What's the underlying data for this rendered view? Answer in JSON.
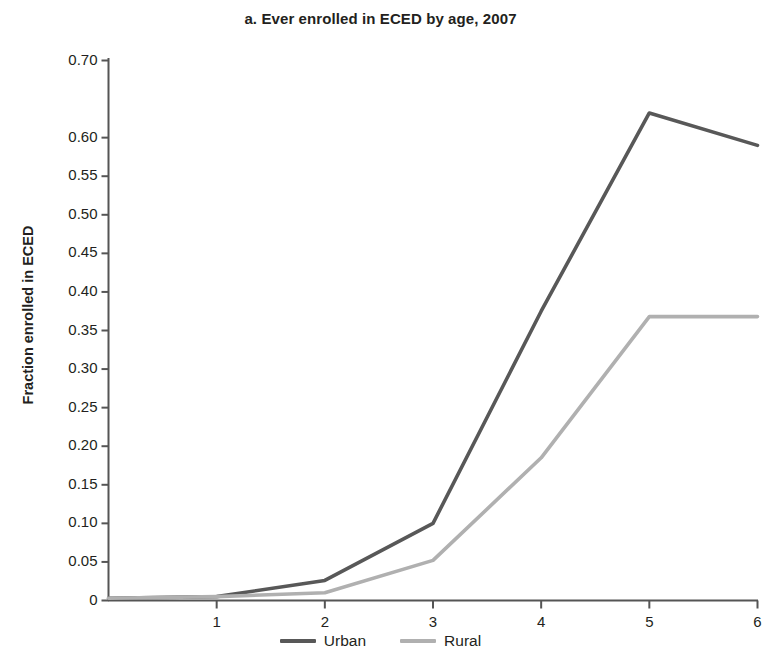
{
  "chart_data": {
    "type": "line",
    "title": "a. Ever enrolled in ECED by age, 2007",
    "xlabel": "",
    "ylabel": "Fraction enrolled in ECED",
    "x": [
      0,
      1,
      2,
      3,
      4,
      5,
      6
    ],
    "xlim": [
      0,
      6
    ],
    "ylim": [
      0,
      0.7
    ],
    "grid": false,
    "legend_position": "bottom-center",
    "xtick_labels": [
      "1",
      "2",
      "3",
      "4",
      "5",
      "6"
    ],
    "xtick_values": [
      1,
      2,
      3,
      4,
      5,
      6
    ],
    "ytick_labels": [
      "0.70",
      "0.60",
      "0.55",
      "0.50",
      "0.45",
      "0.40",
      "0.35",
      "0.30",
      "0.25",
      "0.20",
      "0.15",
      "0.10",
      "0.05",
      "0"
    ],
    "ytick_values": [
      0.7,
      0.6,
      0.55,
      0.5,
      0.45,
      0.4,
      0.35,
      0.3,
      0.25,
      0.2,
      0.15,
      0.1,
      0.05,
      0
    ],
    "series": [
      {
        "name": "Urban",
        "color": "#585858",
        "values": [
          0.003,
          0.005,
          0.026,
          0.1,
          0.375,
          0.632,
          0.59
        ]
      },
      {
        "name": "Rural",
        "color": "#b0b0b0",
        "values": [
          0.003,
          0.005,
          0.01,
          0.052,
          0.185,
          0.368,
          0.368
        ]
      }
    ]
  },
  "legend": {
    "entries": [
      {
        "label": "Urban",
        "color": "#585858"
      },
      {
        "label": "Rural",
        "color": "#b0b0b0"
      }
    ]
  },
  "axis": {
    "color": "#555555"
  }
}
